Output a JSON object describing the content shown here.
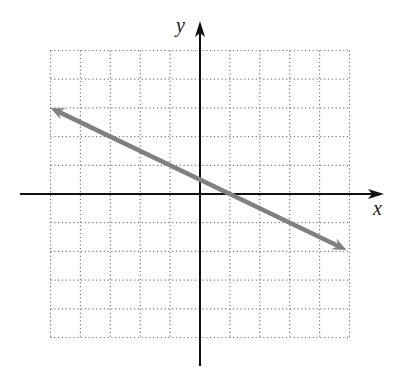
{
  "chart_data": {
    "type": "line",
    "title": "",
    "xlabel": "x",
    "ylabel": "y",
    "xlim": [
      -5,
      5
    ],
    "ylim": [
      -5,
      5
    ],
    "grid": true,
    "grid_style": "dotted",
    "tick_labels": false,
    "series": [
      {
        "name": "line",
        "equation": "y = -0.5x + 0.5",
        "slope": -0.5,
        "intercept": 0.5,
        "x_intercept": 1,
        "arrows_both_ends": true,
        "x": [
          -5,
          5
        ],
        "y": [
          3,
          -2
        ]
      }
    ]
  },
  "colors": {
    "line": "#808080",
    "axes": "#111111",
    "grid": "#7a7a7a"
  },
  "labels": {
    "x_axis": "x",
    "y_axis": "y"
  }
}
